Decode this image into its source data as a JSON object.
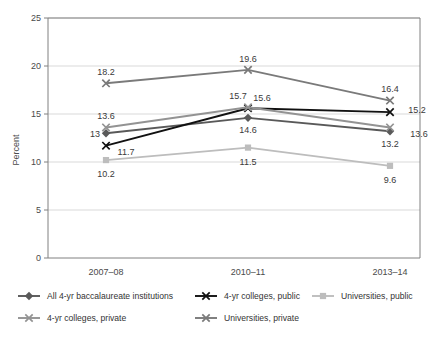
{
  "chart_data": {
    "type": "line",
    "title": "",
    "xlabel": "",
    "ylabel": "Percent",
    "categories": [
      "2007–08",
      "2010–11",
      "2013–14"
    ],
    "ylim": [
      0,
      25
    ],
    "yticks": [
      0,
      5,
      10,
      15,
      20,
      25
    ],
    "grid": true,
    "legend_position": "bottom",
    "series": [
      {
        "name": "All 4-yr baccalaureate institutions",
        "values": [
          13,
          14.6,
          13.2
        ],
        "labels": [
          "13",
          "14.6",
          "13.2"
        ],
        "color": "#595959",
        "marker": "diamond"
      },
      {
        "name": "4-yr colleges, public",
        "values": [
          11.7,
          15.6,
          15.2
        ],
        "labels": [
          "11.7",
          "15.6",
          "15.2"
        ],
        "color": "#111111",
        "marker": "cross"
      },
      {
        "name": "Universities, public",
        "values": [
          10.2,
          11.5,
          9.6
        ],
        "labels": [
          "10.2",
          "11.5",
          "9.6"
        ],
        "color": "#bdbdbd",
        "marker": "square"
      },
      {
        "name": "4-yr colleges, private",
        "values": [
          13.6,
          15.7,
          13.6
        ],
        "labels": [
          "13.6",
          "15.7",
          "13.6"
        ],
        "color": "#939393",
        "marker": "cross"
      },
      {
        "name": "Universities, private",
        "values": [
          18.2,
          19.6,
          16.4
        ],
        "labels": [
          "18.2",
          "19.6",
          "16.4"
        ],
        "color": "#7a7a7a",
        "marker": "cross"
      }
    ]
  },
  "yaxis": {
    "title": "Percent",
    "ticks": [
      "0",
      "5",
      "10",
      "15",
      "20",
      "25"
    ]
  },
  "xaxis": {
    "categories": [
      "2007–08",
      "2010–11",
      "2013–14"
    ]
  },
  "legend": {
    "items": [
      {
        "label": "All 4-yr baccalaureate institutions",
        "color": "#595959",
        "marker": "diamond"
      },
      {
        "label": "4-yr colleges, public",
        "color": "#111111",
        "marker": "cross"
      },
      {
        "label": "Universities, public",
        "color": "#bdbdbd",
        "marker": "square"
      },
      {
        "label": "4-yr colleges, private",
        "color": "#939393",
        "marker": "cross"
      },
      {
        "label": "Universities, private",
        "color": "#7a7a7a",
        "marker": "cross"
      }
    ]
  },
  "point_labels": {
    "s0": [
      "13",
      "14.6",
      "13.2"
    ],
    "s1": [
      "11.7",
      "15.6",
      "15.2"
    ],
    "s2": [
      "10.2",
      "11.5",
      "9.6"
    ],
    "s3": [
      "13.6",
      "15.7",
      "13.6"
    ],
    "s4": [
      "18.2",
      "19.6",
      "16.4"
    ]
  },
  "colors": {
    "gridline": "#d9d9d9",
    "axisline": "#808080",
    "background": "#ffffff",
    "text": "#3a3a3a"
  }
}
